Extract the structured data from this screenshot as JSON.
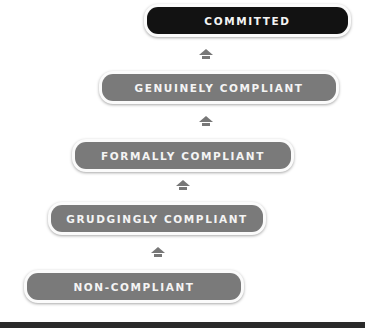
{
  "diagram": {
    "type": "staircase progression",
    "levels": [
      {
        "label": "COMMITTED",
        "style": "dark"
      },
      {
        "label": "GENUINELY COMPLIANT",
        "style": "gray"
      },
      {
        "label": "FORMALLY COMPLIANT",
        "style": "gray"
      },
      {
        "label": "GRUDGINGLY COMPLIANT",
        "style": "gray"
      },
      {
        "label": "NON-COMPLIANT",
        "style": "gray"
      }
    ],
    "arrow_icon": "up-arrow-icon",
    "colors": {
      "dark": "#121212",
      "gray": "#7a7a7a",
      "text": "#f4f4f4",
      "bottom_bar": "#2a2a2a"
    }
  }
}
